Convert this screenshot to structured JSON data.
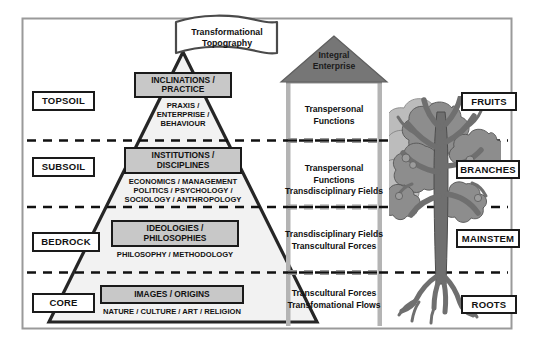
{
  "figure": {
    "banner_label": "Transformational Topography",
    "banner_line1": "Transformational",
    "banner_line2": "Topography"
  },
  "house": {
    "roof_line1": "Integral",
    "roof_line2": "Enterprise",
    "levels": [
      {
        "lines": [
          "Transpersonal Functions"
        ]
      },
      {
        "lines": [
          "Transpersonal Functions",
          "Transdisciplinary Fields"
        ]
      },
      {
        "lines": [
          "Transdisciplinary Fields",
          "Transcultural Forces"
        ]
      },
      {
        "lines": [
          "Transcultural Forces",
          "Transfomational Flows"
        ]
      }
    ]
  },
  "soil_labels": [
    {
      "label": "TOPSOIL"
    },
    {
      "label": "SUBSOIL"
    },
    {
      "label": "BEDROCK"
    },
    {
      "label": "CORE"
    }
  ],
  "tree_labels": [
    {
      "label": "FRUITS"
    },
    {
      "label": "BRANCHES"
    },
    {
      "label": "MAINSTEM"
    },
    {
      "label": "ROOTS"
    }
  ],
  "pyramid": {
    "levels": [
      {
        "box_line1": "INCLINATIONS /",
        "box_line2": "PRACTICE",
        "sub_line1": "PRAXIS /",
        "sub_line2": "ENTERPRISE /",
        "sub_line3": "BEHAVIOUR"
      },
      {
        "box_line1": "INSTITUTIONS /",
        "box_line2": "DISCIPLINES",
        "sub_line1": "ECONOMICS / MANAGEMENT",
        "sub_line2": "POLITICS /  PSYCHOLOGY /",
        "sub_line3": "SOCIOLOGY / ANTHROPOLOGY"
      },
      {
        "box_line1": "IDEOLOGIES /",
        "box_line2": "PHILOSOPHIES",
        "sub_line1": "PHILOSOPHY / METHODOLOGY"
      },
      {
        "box_line1": "IMAGES / ORIGINS",
        "sub_line1": "NATURE / CULTURE / ART / RELIGION"
      }
    ]
  },
  "colors": {
    "box_fill": "#c8c8c8",
    "roof_fill": "#767676",
    "wall_fill": "#b4b4b4",
    "pyramid_fill": "#f2f2f2",
    "outline": "#1a1a1a",
    "frame": "#9a9a9a",
    "foliage_light": "#b9b9b9",
    "foliage_dark": "#8a8a8a",
    "trunk": "#6b6b6b"
  },
  "icons": {
    "banner": "ribbon-banner-icon",
    "roof": "house-roof-icon",
    "tree": "tree-illustration-icon",
    "pyramid": "pyramid-icon"
  }
}
